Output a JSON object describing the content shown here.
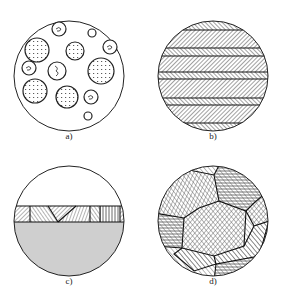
{
  "figure": {
    "panels": [
      {
        "id": "a",
        "label": "a)",
        "description": "circle with scattered spherical inclusions containing dotted texture"
      },
      {
        "id": "b",
        "label": "b)",
        "description": "circle with horizontal lamellar bands of diagonal hatching"
      },
      {
        "id": "c",
        "label": "c)",
        "description": "circle with a thin band of hatched crystal grains above a grey substrate"
      },
      {
        "id": "d",
        "label": "d)",
        "description": "circle with polygonal grains each hatched in a different direction"
      }
    ],
    "colors": {
      "stroke": "#222222",
      "substrate_fill": "#cfcfcf",
      "background": "#ffffff"
    }
  }
}
